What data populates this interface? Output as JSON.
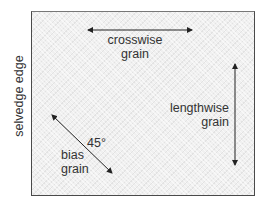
{
  "diagram": {
    "side_label": "selvedge edge",
    "crosswise": {
      "line1": "crosswise",
      "line2": "grain"
    },
    "lengthwise": {
      "line1": "lengthwise",
      "line2": "grain"
    },
    "bias": {
      "angle": "45°",
      "line1": "bias",
      "line2": "grain"
    },
    "colors": {
      "fabric": "#f0f0f0",
      "border": "#4a4a4a",
      "arrow": "#222222",
      "text": "#333333"
    }
  }
}
